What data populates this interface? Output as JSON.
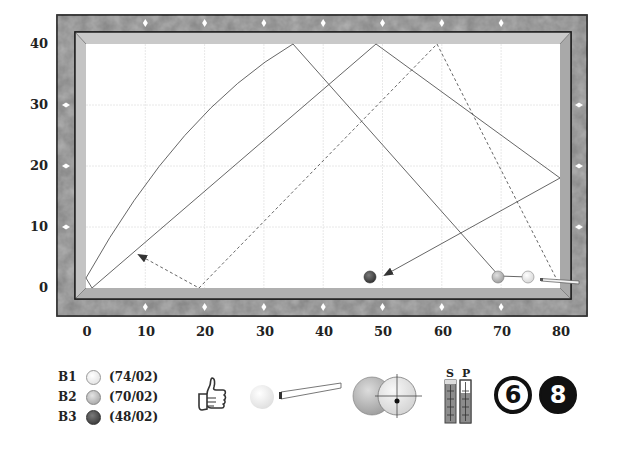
{
  "table": {
    "y_axis_ticks": [
      "40",
      "30",
      "20",
      "10",
      "0"
    ],
    "x_axis_ticks": [
      "0",
      "10",
      "20",
      "30",
      "40",
      "50",
      "60",
      "70",
      "80"
    ],
    "colors": {
      "frame": "#7a7a7a",
      "rail": "#b8b8b8",
      "cloth": "#ffffff",
      "grid": "#e4e4e4",
      "path": "#555555",
      "diamond": "#ffffff"
    }
  },
  "balls": [
    {
      "id": "B1",
      "label": "B1",
      "position": "(74/02)",
      "x": 74,
      "y": 2,
      "color": "#f4f4f4"
    },
    {
      "id": "B2",
      "label": "B2",
      "position": "(70/02)",
      "x": 70,
      "y": 2,
      "color": "#bdbdbd"
    },
    {
      "id": "B3",
      "label": "B3",
      "position": "(48/02)",
      "x": 48,
      "y": 2,
      "color": "#4a4a4a"
    }
  ],
  "paths": [
    {
      "name": "cue-ball-path-curved",
      "style": "solid",
      "points": [
        [
          0,
          2
        ],
        [
          35,
          40
        ],
        [
          70,
          2
        ]
      ]
    },
    {
      "name": "object-ball-path",
      "style": "solid",
      "points": [
        [
          1,
          0
        ],
        [
          49,
          40
        ],
        [
          80,
          18
        ],
        [
          51,
          2
        ]
      ]
    },
    {
      "name": "alternate-path",
      "style": "dashed",
      "points": [
        [
          79,
          1
        ],
        [
          59,
          40
        ],
        [
          19,
          0
        ],
        [
          9,
          5
        ]
      ]
    }
  ],
  "indicators": {
    "rating": "thumbs-up",
    "spin_labels": {
      "s": "S",
      "p": "P"
    },
    "difficulty_number": "6",
    "ball_number": "8"
  }
}
